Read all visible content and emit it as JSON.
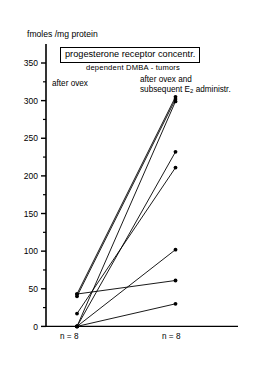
{
  "figure": {
    "axis_title": "fmoles /mg protein",
    "title": "progesterone receptor concentr.",
    "subtitle": "dependent  DMBA - tumors",
    "group_left_label": "after ovex",
    "group_right_label_line1": "after ovex  and",
    "group_right_label_line2_pre": "subsequent E",
    "group_right_label_sub": "2",
    "group_right_label_line2_post": " administr.",
    "n_left": "n = 8",
    "n_right": "n = 8",
    "line_color": "#000000",
    "marker_color": "#000000"
  },
  "chart_data": {
    "type": "line",
    "title": "progesterone receptor concentr.",
    "subtitle": "dependent DMBA - tumors",
    "ylabel": "fmoles /mg protein",
    "xlabel": "",
    "categories": [
      "after ovex",
      "after ovex and subsequent E2 administr."
    ],
    "ylim": [
      0,
      375
    ],
    "yticks": [
      0,
      50,
      100,
      150,
      200,
      250,
      300,
      350
    ],
    "ytick_labels": [
      "0",
      "50",
      "100",
      "150",
      "200",
      "250",
      "300",
      "350"
    ],
    "minor_tick_step": 25,
    "grid": false,
    "legend": "none",
    "n_per_group": 8,
    "paired": true,
    "series": [
      {
        "name": "subject-1",
        "values": [
          43,
          305
        ]
      },
      {
        "name": "subject-2",
        "values": [
          40,
          302
        ]
      },
      {
        "name": "subject-3",
        "values": [
          0,
          299
        ]
      },
      {
        "name": "subject-4",
        "values": [
          0,
          232
        ]
      },
      {
        "name": "subject-5",
        "values": [
          17,
          211
        ]
      },
      {
        "name": "subject-6",
        "values": [
          0,
          102
        ]
      },
      {
        "name": "subject-7",
        "values": [
          43,
          61
        ]
      },
      {
        "name": "subject-8",
        "values": [
          0,
          30
        ]
      }
    ]
  }
}
